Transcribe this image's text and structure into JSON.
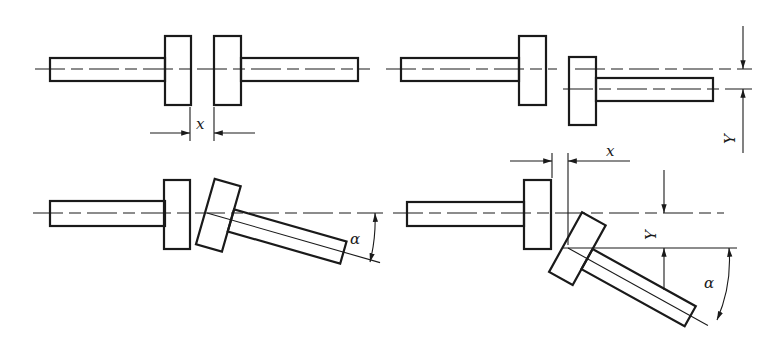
{
  "diagram": {
    "panels": [
      {
        "id": "axial",
        "position": "top-left",
        "labels": [
          "x"
        ]
      },
      {
        "id": "radial",
        "position": "top-right",
        "labels": [
          "Y",
          "x"
        ]
      },
      {
        "id": "angular",
        "position": "bottom-left",
        "labels": [
          "α"
        ]
      },
      {
        "id": "combined",
        "position": "bottom-right",
        "labels": [
          "x",
          "Y",
          "α"
        ]
      }
    ],
    "labels": {
      "axial_x": "x",
      "radial_y": "Y",
      "radial_x": "x",
      "angular_alpha": "α",
      "combined_y": "Y",
      "combined_alpha": "α"
    },
    "colors": {
      "line": "#1a1a1a",
      "background": "#ffffff"
    }
  }
}
